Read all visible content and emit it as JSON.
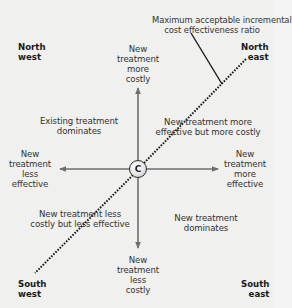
{
  "diagram": {
    "type": "cost-effectiveness plane",
    "threshold_label": {
      "line1": "Maximum acceptable incremental",
      "line2": "cost effectiveness ratio"
    },
    "corners": {
      "north_west": {
        "line1": "North",
        "line2": "west"
      },
      "north_east": {
        "line1": "North",
        "line2": "east"
      },
      "south_west": {
        "line1": "South",
        "line2": "west"
      },
      "south_east": {
        "line1": "South",
        "line2": "east"
      }
    },
    "axes": {
      "up": {
        "line1": "New",
        "line2": "treatment",
        "line3": "more",
        "line4": "costly"
      },
      "down": {
        "line1": "New",
        "line2": "treatment",
        "line3": "less",
        "line4": "costly"
      },
      "left": {
        "line1": "New",
        "line2": "treatment",
        "line3": "less",
        "line4": "effective"
      },
      "right": {
        "line1": "New",
        "line2": "treatment",
        "line3": "more",
        "line4": "effective"
      }
    },
    "quadrants": {
      "nw": {
        "line1": "Existing treatment",
        "line2": "dominates"
      },
      "ne": {
        "line1": "New treatment more",
        "line2": "effective but more costly"
      },
      "sw": {
        "line1": "New treatment less",
        "line2": "costly but less effective"
      },
      "se": {
        "line1": "New treatment",
        "line2": "dominates"
      }
    },
    "origin_label": "C",
    "colors": {
      "background": "#f0f0ee",
      "axis": "#6e6e6e",
      "threshold": "#1a1a1a",
      "text": "#333333"
    }
  }
}
